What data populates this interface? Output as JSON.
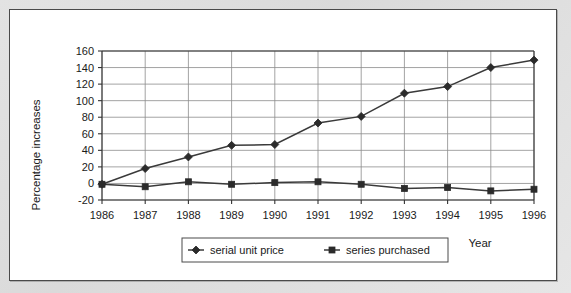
{
  "chart_data": {
    "type": "line",
    "title": "",
    "xlabel": "Year",
    "ylabel": "Percentage increases",
    "categories": [
      "1986",
      "1987",
      "1988",
      "1989",
      "1990",
      "1991",
      "1992",
      "1993",
      "1994",
      "1995",
      "1996"
    ],
    "x": [
      1986,
      1987,
      1988,
      1989,
      1990,
      1991,
      1992,
      1993,
      1994,
      1995,
      1996
    ],
    "series": [
      {
        "name": "serial unit price",
        "marker": "diamond",
        "color": "#2b2b2b",
        "values": [
          -1,
          18,
          32,
          46,
          47,
          73,
          81,
          109,
          117,
          140,
          149
        ]
      },
      {
        "name": "series purchased",
        "marker": "square",
        "color": "#2b2b2b",
        "values": [
          -1,
          -4,
          2,
          -1,
          1,
          2,
          -1,
          -6,
          -5,
          -9,
          -7
        ]
      }
    ],
    "ylim": [
      -20,
      160
    ],
    "ytick_values": [
      -20,
      0,
      20,
      40,
      60,
      80,
      100,
      120,
      140,
      160
    ],
    "ytick_labels": [
      "-20",
      "0",
      "20",
      "40",
      "60",
      "80",
      "100",
      "120",
      "140",
      "160"
    ],
    "xtick_labels": [
      "1986",
      "1987",
      "1988",
      "1989",
      "1990",
      "1991",
      "1992",
      "1993",
      "1994",
      "1995",
      "1996"
    ],
    "grid": true,
    "grid_axis": "both",
    "legend_position": "bottom",
    "legend_entries": [
      "serial unit price",
      "series purchased"
    ]
  },
  "figure": {
    "background_color": "#ffffff",
    "page_color": "#dedede",
    "border_color": "#4a4a4a",
    "grid_color": "#8c8c8c",
    "line_color": "#3a3a3a"
  }
}
